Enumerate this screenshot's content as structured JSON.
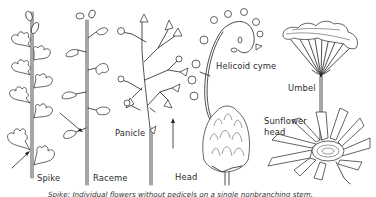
{
  "figure": {
    "topic": "Inflorescence types",
    "labels": {
      "spike": "Spike",
      "raceme": "Raceme",
      "panicle": "Panicle",
      "helicoid_cyme": "Helicoid cyme",
      "umbel": "Umbel",
      "head": "Head",
      "sunflower_head_line1": "Sunflower",
      "sunflower_head_line2": "head"
    },
    "caption": "Spike: Individual flowers without pedicels on a single nonbranching stem."
  }
}
